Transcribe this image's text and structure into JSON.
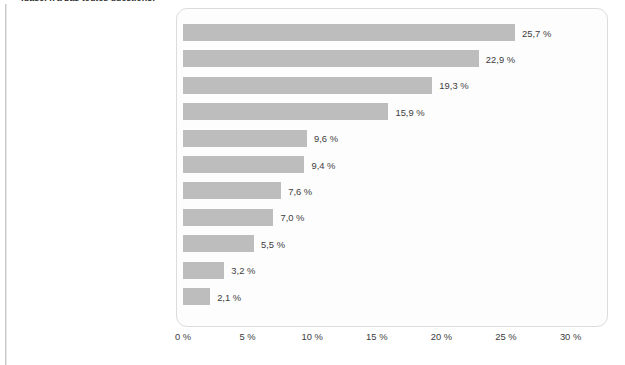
{
  "caption": {
    "clipped_text": "(base: n'a pas toutes questions)"
  },
  "chart_data": {
    "type": "bar",
    "orientation": "horizontal",
    "title": "",
    "subtitle": "",
    "xlabel": "",
    "ylabel": "",
    "xlim": [
      0,
      30
    ],
    "grid": false,
    "legend": null,
    "bar_color": "#bdbdbd",
    "frame_color": "#dcdcdc",
    "text_color": "#3c3c3c",
    "tick_labels": [
      "0 %",
      "5 %",
      "10 %",
      "15 %",
      "20 %",
      "25 %",
      "30 %"
    ],
    "tick_values": [
      0,
      5,
      10,
      15,
      20,
      25,
      30
    ],
    "categories": [
      "Visité un wiki",
      "Visité un site de réseautage",
      "Consulté un blogue sur Internet",
      "Participé à un site de réseautage",
      "Fait de la baladodiffusion",
      "Téléchargé des photos vers un site\nréservé à cette fin sur Internet",
      "Téléchargé une vidéo vers un site\nréservé à cette fin sur Internet",
      "Commenté le blogue\nd’une autre personne",
      "Écrit sur votre blogue personnel",
      "Adhéré à un fil RSS",
      "Écrit sur un wiki"
    ],
    "values": [
      25.7,
      22.9,
      19.3,
      15.9,
      9.6,
      9.4,
      7.6,
      7.0,
      5.5,
      3.2,
      2.1
    ],
    "value_labels": [
      "25,7 %",
      "22,9 %",
      "19,3 %",
      "15,9 %",
      "9,6 %",
      "9,4 %",
      "7,6 %",
      "7,0 %",
      "5,5 %",
      "3,2 %",
      "2,1 %"
    ]
  }
}
